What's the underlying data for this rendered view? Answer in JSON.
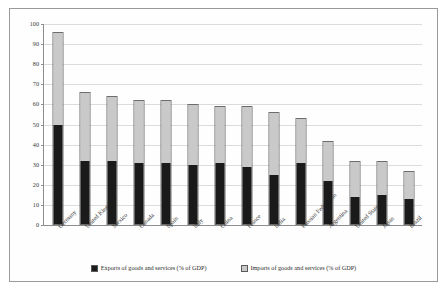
{
  "chart_data": {
    "type": "bar",
    "subtype": "stacked-column",
    "title": "",
    "xlabel": "",
    "ylabel": "",
    "ylim": [
      0,
      100
    ],
    "ytick_step": 10,
    "yticks": [
      0,
      10,
      20,
      30,
      40,
      50,
      60,
      70,
      80,
      90,
      100
    ],
    "grid": true,
    "legend_position": "bottom",
    "categories": [
      "Germany",
      "United Kingdom",
      "Mexico",
      "Canada",
      "Spain",
      "Italy",
      "China",
      "France",
      "India",
      "Russian Federation",
      "Argentina",
      "United States",
      "Japan",
      "Brazil"
    ],
    "series": [
      {
        "name": "Exports of goods and services (% of GDP)",
        "color": "#1a1a1a",
        "values": [
          50,
          32,
          32,
          31,
          31,
          30,
          31,
          29,
          25,
          31,
          22,
          14,
          15,
          13
        ]
      },
      {
        "name": "Imports of goods and services (% of GDP)",
        "color": "#c9c9c9",
        "values": [
          46,
          34,
          32,
          31,
          31,
          30,
          28,
          30,
          31,
          22,
          20,
          18,
          17,
          14
        ]
      }
    ],
    "totals": [
      96,
      66,
      64,
      62,
      62,
      60,
      59,
      59,
      56,
      53,
      42,
      32,
      32,
      27
    ]
  },
  "legend": {
    "items": [
      {
        "label": "Exports of goods and services (% of GDP)",
        "swatch": "exports-swatch"
      },
      {
        "label": "Imports of goods and services (% of GDP)",
        "swatch": "imports-swatch"
      }
    ]
  }
}
